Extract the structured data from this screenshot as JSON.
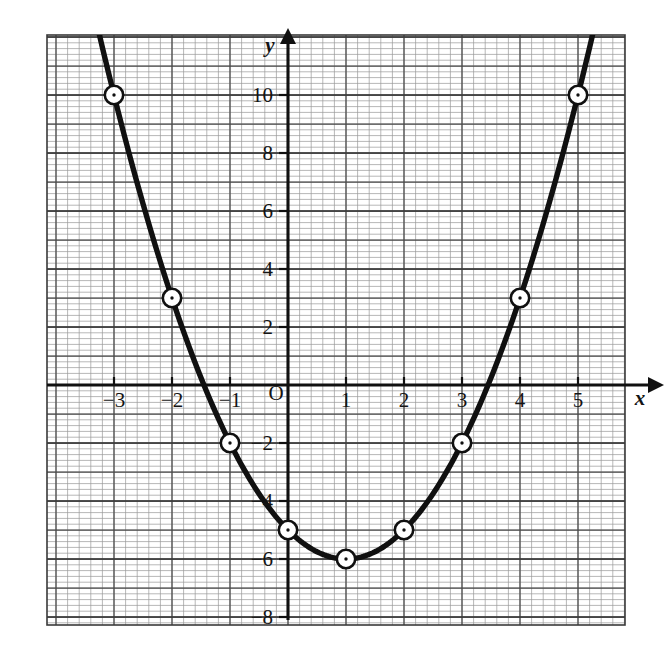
{
  "figure": {
    "background_color": "#ffffff",
    "paper": {
      "minor_grid_color": "#9a9a9a",
      "major_grid_color": "#4a4a4a",
      "border_color": "#3a3a3a",
      "minor_spacing_units": 0.2,
      "major_spacing_units": 1
    },
    "curve_color": "#101010",
    "marker_fill": "#ffffff",
    "marker_stroke": "#101010"
  },
  "axes": {
    "x_axis_name": "x",
    "y_axis_name": "y",
    "origin_label": "O",
    "x_tick_labels": [
      "−3",
      "−2",
      "−1",
      "1",
      "2",
      "3",
      "4",
      "5"
    ],
    "y_tick_labels": [
      "10",
      "8",
      "6",
      "4",
      "2",
      "−2",
      "−4",
      "−6",
      "−8"
    ],
    "x_arrow": "right-arrowhead",
    "y_arrow": "up-arrowhead"
  },
  "chart_data": {
    "type": "line",
    "title": "",
    "subtitle": "",
    "xlabel": "x",
    "ylabel": "y",
    "xlim": [
      -3.9,
      5.9
    ],
    "ylim": [
      -8.6,
      12.0
    ],
    "xticks": [
      -3,
      -2,
      -1,
      0,
      1,
      2,
      3,
      4,
      5
    ],
    "yticks": [
      -8,
      -6,
      -4,
      -2,
      0,
      2,
      4,
      6,
      8,
      10
    ],
    "xtick_labels": [
      "−3",
      "−2",
      "−1",
      "O",
      "1",
      "2",
      "3",
      "4",
      "5"
    ],
    "ytick_labels": [
      "−8",
      "−6",
      "−4",
      "−2",
      "",
      "2",
      "4",
      "6",
      "8",
      "10"
    ],
    "grid": true,
    "legend": "none",
    "equation": "y = x^2 - 2x - 5",
    "vertex": [
      1,
      -6
    ],
    "series": [
      {
        "name": "y = x² − 2x − 5",
        "marker": "open-circle-with-dot",
        "x": [
          -3,
          -2,
          -1,
          0,
          1,
          2,
          3,
          4,
          5
        ],
        "values": [
          10,
          3,
          -2,
          -5,
          -6,
          -5,
          -2,
          3,
          10
        ]
      }
    ],
    "plotted_points": [
      {
        "x": -3,
        "y": 10
      },
      {
        "x": -2,
        "y": 3
      },
      {
        "x": -1,
        "y": -2
      },
      {
        "x": 0,
        "y": -5
      },
      {
        "x": 1,
        "y": -6
      },
      {
        "x": 2,
        "y": -5
      },
      {
        "x": 3,
        "y": -2
      },
      {
        "x": 4,
        "y": 3
      },
      {
        "x": 5,
        "y": 10
      }
    ]
  }
}
